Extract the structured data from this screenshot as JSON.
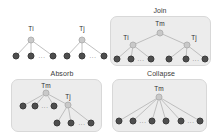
{
  "figure": {
    "colors": {
      "panel_background": "#ececec",
      "panel_border": "#d8d8d8",
      "leaf_node": "#4e4e4e",
      "internal_node": "#c9c9c9",
      "edge": "#b9b9b9",
      "text": "#2f2f2f",
      "page_background": "#ffffff"
    },
    "ellipsis_text": "..."
  },
  "sources": {
    "tree_i": {
      "root_label": "Ti",
      "root": {
        "x": 31,
        "y": 40
      },
      "leaves": [
        {
          "x": 16,
          "y": 56
        },
        {
          "x": 31,
          "y": 56
        },
        {
          "x": 53,
          "y": 56
        }
      ],
      "ellipsis": [
        {
          "x": 42,
          "y": 56
        }
      ],
      "label_pos": {
        "x": 31,
        "y": 28
      }
    },
    "tree_j": {
      "root_label": "Tj",
      "root": {
        "x": 82,
        "y": 40
      },
      "leaves": [
        {
          "x": 67,
          "y": 56
        },
        {
          "x": 82,
          "y": 56
        },
        {
          "x": 104,
          "y": 56
        }
      ],
      "ellipsis": [
        {
          "x": 93,
          "y": 56
        }
      ],
      "label_pos": {
        "x": 82,
        "y": 28
      }
    }
  },
  "panels": [
    {
      "id": "join",
      "title": "Join",
      "title_pos": {
        "x": 160,
        "y": 10
      },
      "box": {
        "x": 110,
        "y": 16,
        "w": 101,
        "h": 50
      },
      "nodes": {
        "root": {
          "label": "Tm",
          "x": 160,
          "y": 33,
          "label_pos": {
            "x": 160,
            "y": 23
          }
        },
        "left": {
          "label": "Ti",
          "x": 133,
          "y": 45,
          "label_pos": {
            "x": 126,
            "y": 37
          }
        },
        "right": {
          "label": "Tj",
          "x": 187,
          "y": 45,
          "label_pos": {
            "x": 194,
            "y": 37
          }
        }
      },
      "leaves": [
        {
          "x": 117,
          "y": 59,
          "parent": "left"
        },
        {
          "x": 131,
          "y": 59,
          "parent": "left"
        },
        {
          "x": 151,
          "y": 59,
          "parent": "left"
        },
        {
          "x": 169,
          "y": 59,
          "parent": "right"
        },
        {
          "x": 186,
          "y": 59,
          "parent": "right"
        },
        {
          "x": 205,
          "y": 59,
          "parent": "right"
        }
      ],
      "ellipsis": [
        {
          "x": 141,
          "y": 59
        },
        {
          "x": 196,
          "y": 59
        }
      ]
    },
    {
      "id": "absorb",
      "title": "Absorb",
      "title_pos": {
        "x": 62,
        "y": 73
      },
      "box": {
        "x": 11,
        "y": 79,
        "w": 91,
        "h": 53
      },
      "nodes": {
        "root": {
          "label": "Tm",
          "x": 46,
          "y": 93,
          "label_pos": {
            "x": 46,
            "y": 85
          }
        },
        "child": {
          "label": "Tj",
          "x": 68,
          "y": 105,
          "label_pos": {
            "x": 68,
            "y": 96
          }
        }
      },
      "leaves": [
        {
          "x": 23,
          "y": 106,
          "parent": "root"
        },
        {
          "x": 35,
          "y": 106,
          "parent": "root"
        },
        {
          "x": 54,
          "y": 106,
          "parent": "root"
        },
        {
          "x": 57,
          "y": 123,
          "parent": "child"
        },
        {
          "x": 71,
          "y": 123,
          "parent": "child"
        },
        {
          "x": 91,
          "y": 123,
          "parent": "child"
        }
      ],
      "ellipsis": [
        {
          "x": 45,
          "y": 106
        },
        {
          "x": 82,
          "y": 123
        }
      ]
    },
    {
      "id": "collapse",
      "title": "Collapse",
      "title_pos": {
        "x": 161,
        "y": 73
      },
      "box": {
        "x": 112,
        "y": 79,
        "w": 95,
        "h": 53
      },
      "nodes": {
        "root": {
          "label": "Tm",
          "x": 159,
          "y": 97,
          "label_pos": {
            "x": 159,
            "y": 88
          }
        }
      },
      "leaves": [
        {
          "x": 119,
          "y": 121,
          "parent": "root"
        },
        {
          "x": 133,
          "y": 121,
          "parent": "root"
        },
        {
          "x": 152,
          "y": 121,
          "parent": "root"
        },
        {
          "x": 166,
          "y": 121,
          "parent": "root"
        },
        {
          "x": 181,
          "y": 121,
          "parent": "root"
        },
        {
          "x": 200,
          "y": 121,
          "parent": "root"
        }
      ],
      "ellipsis": [
        {
          "x": 143,
          "y": 121
        },
        {
          "x": 191,
          "y": 121
        }
      ]
    }
  ]
}
